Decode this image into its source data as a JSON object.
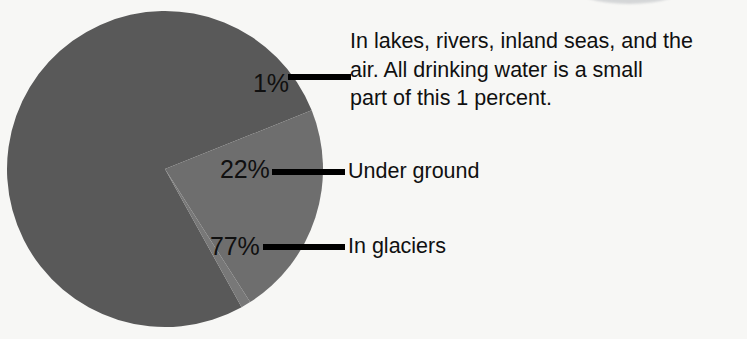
{
  "background_color": "#f7f7f5",
  "chart_data": {
    "type": "pie",
    "title": "",
    "subtitle": "",
    "xlabel": "",
    "ylabel": "",
    "legend_position": "right-callouts",
    "grid": false,
    "unit": "percent",
    "center": {
      "x": 165,
      "y": 169
    },
    "radius": 158,
    "categories": [
      "In glaciers",
      "Under ground",
      "In lakes, rivers, inland seas, and the air"
    ],
    "values": [
      77,
      22,
      1
    ],
    "slices": [
      {
        "name": "In glaciers",
        "value": 77,
        "value_label": "77%",
        "callout": "In glaciers",
        "color": "#595959",
        "start_angle_deg": 61,
        "end_angle_deg": 338.2
      },
      {
        "name": "Under ground",
        "value": 22,
        "value_label": "22%",
        "callout": "Under ground",
        "color": "#6e6e6e",
        "start_angle_deg": 338.2,
        "end_angle_deg": 417.4
      },
      {
        "name": "In lakes, rivers, inland seas, and the air",
        "value": 1,
        "value_label": "1%",
        "callout": "In lakes, rivers, inland seas, and the\nair. All drinking water is a small\npart of this 1 percent.",
        "color": "#787878",
        "start_angle_deg": 417.4,
        "end_angle_deg": 421
      }
    ]
  },
  "labels": {
    "pct_one": "1%",
    "pct_twentytwo": "22%",
    "pct_seventyseven": "77%"
  },
  "callouts": {
    "lakes": "In lakes, rivers, inland seas, and the\nair. All drinking water is a small\npart of this 1 percent.",
    "under_ground": "Under ground",
    "glaciers": "In glaciers"
  },
  "colors": {
    "slice_glaciers": "#595959",
    "slice_underground": "#6e6e6e",
    "slice_lakes": "#787878",
    "leader_line": "#000000",
    "text": "#101010",
    "background": "#f7f7f5",
    "top_arc": "#b9bcc0"
  }
}
